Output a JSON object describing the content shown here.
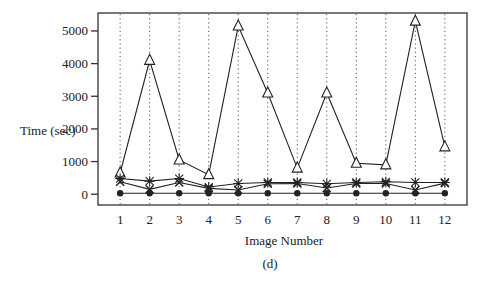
{
  "chart_data": {
    "type": "line",
    "title": "",
    "caption": "(d)",
    "xlabel": "Image Number",
    "ylabel": "Time (sec)",
    "x": [
      1,
      2,
      3,
      4,
      5,
      6,
      7,
      8,
      9,
      10,
      11,
      12
    ],
    "x_tick_labels": [
      "1",
      "2",
      "3",
      "4",
      "5",
      "6",
      "7",
      "8",
      "9",
      "10",
      "11",
      "12"
    ],
    "y_ticks": [
      0,
      1000,
      2000,
      3000,
      4000,
      5000
    ],
    "y_tick_labels": [
      "0",
      "1000",
      "2000",
      "3000",
      "4000",
      "5000"
    ],
    "ylim": [
      -330,
      5550
    ],
    "xlim": [
      0.25,
      12.75
    ],
    "grid": {
      "vertical_dotted_at_x_ticks": true,
      "horizontal": false
    },
    "legend": null,
    "series": [
      {
        "name": "triangle",
        "marker": "triangle-open",
        "values": [
          650,
          4100,
          1050,
          600,
          5150,
          3100,
          800,
          3100,
          950,
          900,
          5300,
          1450
        ]
      },
      {
        "name": "asterisk",
        "marker": "asterisk",
        "values": [
          480,
          400,
          480,
          220,
          330,
          360,
          360,
          320,
          360,
          380,
          360,
          360
        ]
      },
      {
        "name": "cross",
        "marker": "plus",
        "values": [
          380,
          150,
          360,
          180,
          130,
          320,
          330,
          190,
          330,
          330,
          130,
          340
        ]
      },
      {
        "name": "circle",
        "marker": "circle-filled",
        "values": [
          30,
          30,
          30,
          30,
          30,
          30,
          30,
          30,
          30,
          30,
          30,
          30
        ]
      }
    ]
  },
  "colors": {
    "line": "#222222",
    "frame": "#333333",
    "grid": "#555555",
    "background": "#ffffff"
  }
}
